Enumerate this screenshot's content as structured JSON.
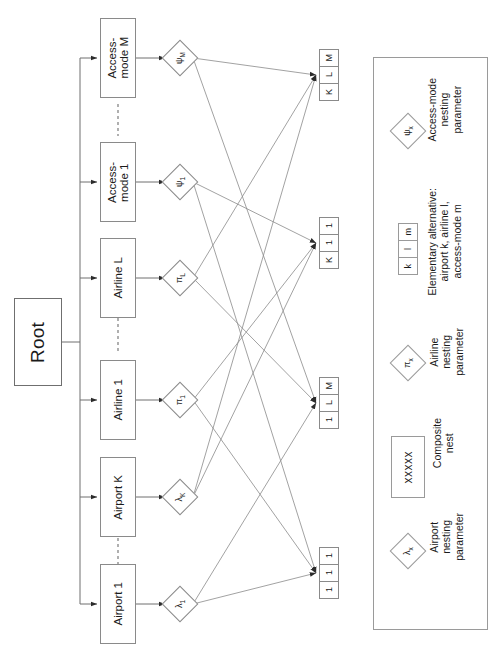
{
  "diagram": {
    "title_text": "Nested logit tree: airport / airline / access-mode",
    "orientation": "rotated-90",
    "root": {
      "label": "Root"
    },
    "nests": [
      {
        "id": "access-mode-m",
        "label": "Access-\nmode M",
        "param": "ψ",
        "sub": "M"
      },
      {
        "id": "access-mode-1",
        "label": "Access-\nmode 1",
        "param": "ψ",
        "sub": "1"
      },
      {
        "id": "airline-l",
        "label": "Airline L",
        "param": "π",
        "sub": "L"
      },
      {
        "id": "airline-1",
        "label": "Airline 1",
        "param": "π",
        "sub": "1"
      },
      {
        "id": "airport-k",
        "label": "Airport K",
        "param": "λ",
        "sub": "K"
      },
      {
        "id": "airport-1",
        "label": "Airport 1",
        "param": "λ",
        "sub": "1"
      }
    ],
    "alternatives": [
      {
        "id": "alt-klm",
        "cells": [
          "K",
          "L",
          "M"
        ]
      },
      {
        "id": "alt-k11",
        "cells": [
          "K",
          "1",
          "1"
        ]
      },
      {
        "id": "alt-1lm",
        "cells": [
          "1",
          "L",
          "M"
        ]
      },
      {
        "id": "alt-111",
        "cells": [
          "1",
          "1",
          "1"
        ]
      }
    ],
    "ellipsis": "- - - - -"
  },
  "legend": {
    "items": [
      {
        "id": "airport-nesting",
        "glyph": "diamond",
        "symbol": "λ",
        "sub": "x",
        "text": "Airport\nnesting\nparameter"
      },
      {
        "id": "composite-nest",
        "glyph": "box",
        "symbol": "xxxxx",
        "text": "Composite\nnest"
      },
      {
        "id": "airline-nesting",
        "glyph": "diamond",
        "symbol": "π",
        "sub": "x",
        "text": "Airline\nnesting\nparameter"
      },
      {
        "id": "elementary-alt",
        "glyph": "altbox",
        "cells": [
          "k",
          "l",
          "m"
        ],
        "text": "Elementary alternative:\nairport k, airline l,\naccess-mode m"
      },
      {
        "id": "access-mode-nesting",
        "glyph": "diamond",
        "symbol": "ψ",
        "sub": "x",
        "text": "Access-mode\nnesting\nparameter"
      }
    ]
  },
  "colors": {
    "stroke": "#8a8a8a",
    "line": "#6f6f6f",
    "text": "#1a1a1a",
    "background": "#ffffff"
  }
}
